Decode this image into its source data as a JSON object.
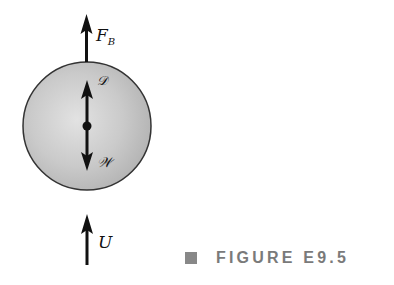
{
  "figure": {
    "caption": "FIGURE E9.5",
    "caption_color": "#7a7a7a",
    "marker_color": "#888888"
  },
  "diagram": {
    "body": {
      "shape": "sphere",
      "fill": "#c8c8c8",
      "outline": "#333333"
    },
    "forces": [
      {
        "name": "buoyant-force",
        "label_main": "F",
        "label_sub": "B",
        "direction": "up",
        "position": "above-sphere"
      },
      {
        "name": "drag-force",
        "label": "𝒟",
        "direction": "up",
        "position": "inside-sphere"
      },
      {
        "name": "weight",
        "label": "𝒲",
        "direction": "down",
        "position": "inside-sphere"
      },
      {
        "name": "velocity",
        "label": "U",
        "direction": "up",
        "position": "below-sphere"
      }
    ]
  }
}
